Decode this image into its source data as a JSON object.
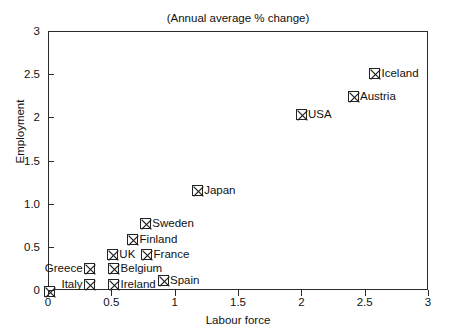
{
  "chart_data": {
    "type": "scatter",
    "title": "(Annual average % change)",
    "xlabel": "Labour force",
    "ylabel": "Employment",
    "xlim": [
      0,
      3
    ],
    "ylim": [
      0,
      3
    ],
    "grid": false,
    "legend": "none",
    "xticks": [
      "0",
      "0.5",
      "1",
      "1.5",
      "2",
      "2.5",
      "3"
    ],
    "xtick_values": [
      0,
      0.5,
      1,
      1.5,
      2,
      2.5,
      3
    ],
    "yticks": [
      "0",
      "0.5",
      "1.0",
      "1.5",
      "2",
      "2.5",
      "3"
    ],
    "ytick_values": [
      0,
      0.5,
      1.0,
      1.5,
      2,
      2.5,
      3
    ],
    "marker_style": "square-with-x",
    "points": [
      {
        "label": "",
        "x": 0.0,
        "y": 0.0,
        "label_pos": "right"
      },
      {
        "label": "Italy",
        "x": 0.32,
        "y": 0.07,
        "label_pos": "left"
      },
      {
        "label": "Greece",
        "x": 0.32,
        "y": 0.26,
        "label_pos": "left"
      },
      {
        "label": "UK",
        "x": 0.5,
        "y": 0.42,
        "label_pos": "right"
      },
      {
        "label": "Belgium",
        "x": 0.51,
        "y": 0.26,
        "label_pos": "right"
      },
      {
        "label": "Ireland",
        "x": 0.51,
        "y": 0.07,
        "label_pos": "right"
      },
      {
        "label": "France",
        "x": 0.77,
        "y": 0.42,
        "label_pos": "right"
      },
      {
        "label": "Finland",
        "x": 0.66,
        "y": 0.6,
        "label_pos": "right"
      },
      {
        "label": "Sweden",
        "x": 0.76,
        "y": 0.78,
        "label_pos": "right"
      },
      {
        "label": "Spain",
        "x": 0.9,
        "y": 0.12,
        "label_pos": "right"
      },
      {
        "label": "Japan",
        "x": 1.17,
        "y": 1.16,
        "label_pos": "right"
      },
      {
        "label": "USA",
        "x": 1.99,
        "y": 2.04,
        "label_pos": "right"
      },
      {
        "label": "Austria",
        "x": 2.4,
        "y": 2.25,
        "label_pos": "right"
      },
      {
        "label": "Iceland",
        "x": 2.57,
        "y": 2.52,
        "label_pos": "right"
      }
    ]
  }
}
